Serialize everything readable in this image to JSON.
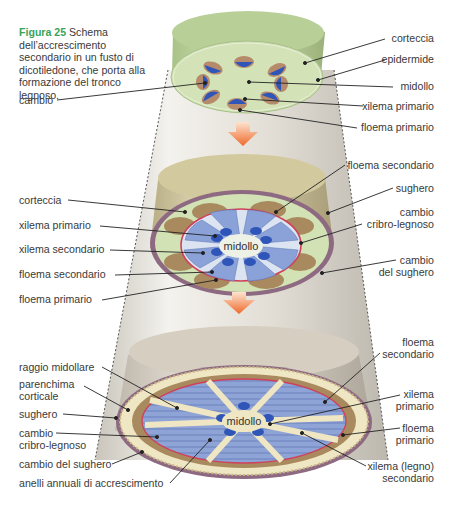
{
  "caption": {
    "figure_number": "Figura 25",
    "text": " Schema dell’accrescimento secondario in un fusto di dicotiledone, che porta alla formazione del tronco legnoso."
  },
  "stages": [
    {
      "name": "primary-structure",
      "center_label": "",
      "labels_left": [
        {
          "id": "cambio",
          "text": "cambio"
        }
      ],
      "labels_right": [
        {
          "id": "corteccia",
          "text": "corteccia"
        },
        {
          "id": "epidermide",
          "text": "epidermide"
        },
        {
          "id": "midollo",
          "text": "midollo"
        },
        {
          "id": "xilema-primario",
          "text": "xilema primario"
        },
        {
          "id": "floema-primario",
          "text": "floema primario"
        }
      ]
    },
    {
      "name": "early-secondary-growth",
      "center_label": "midollo",
      "labels_left": [
        {
          "id": "corteccia",
          "text": "corteccia"
        },
        {
          "id": "xilema-primario",
          "text": "xilema primario"
        },
        {
          "id": "xilema-secondario",
          "text": "xilema secondario"
        },
        {
          "id": "floema-secondario",
          "text": "floema secondario"
        },
        {
          "id": "floema-primario",
          "text": "floema primario"
        }
      ],
      "labels_right": [
        {
          "id": "floema-secondario",
          "text": "floema secondario"
        },
        {
          "id": "sughero",
          "text": "sughero"
        },
        {
          "id": "cambio-cribro-legnoso",
          "text": "cambio\ncribro-legnoso"
        },
        {
          "id": "cambio-del-sughero",
          "text": "cambio\ndel sughero"
        }
      ]
    },
    {
      "name": "woody-trunk",
      "center_label": "midollo",
      "labels_left": [
        {
          "id": "raggio-midollare",
          "text": "raggio midollare"
        },
        {
          "id": "parenchima-corticale",
          "text": "parenchima\ncorticale"
        },
        {
          "id": "sughero",
          "text": "sughero"
        },
        {
          "id": "cambio-cribro-legnoso",
          "text": "cambio\ncribro-legnoso"
        },
        {
          "id": "cambio-del-sughero",
          "text": "cambio del sughero"
        },
        {
          "id": "anelli-annuali",
          "text": "anelli annuali di accrescimento"
        }
      ],
      "labels_right": [
        {
          "id": "floema-secondario",
          "text": "floema\nsecondario"
        },
        {
          "id": "xilema-primario",
          "text": "xilema\nprimario"
        },
        {
          "id": "floema-primario",
          "text": "floema\nprimario"
        },
        {
          "id": "xilema-legno-secondario",
          "text": "xilema (legno)\nsecondario"
        }
      ]
    }
  ],
  "colors": {
    "caption_accent": "#3aa35a",
    "cortex_green": "#cfe0b0",
    "xylem_blue": "#2f55b8",
    "secondary_xylem_blue": "#8aa2d8",
    "phloem_brown": "#a88a5e",
    "cambium_red": "#d0405a",
    "cork_purple": "#8e6a82",
    "bark_tan": "#d8cfa8",
    "arrow_orange": "#f07a3a"
  }
}
